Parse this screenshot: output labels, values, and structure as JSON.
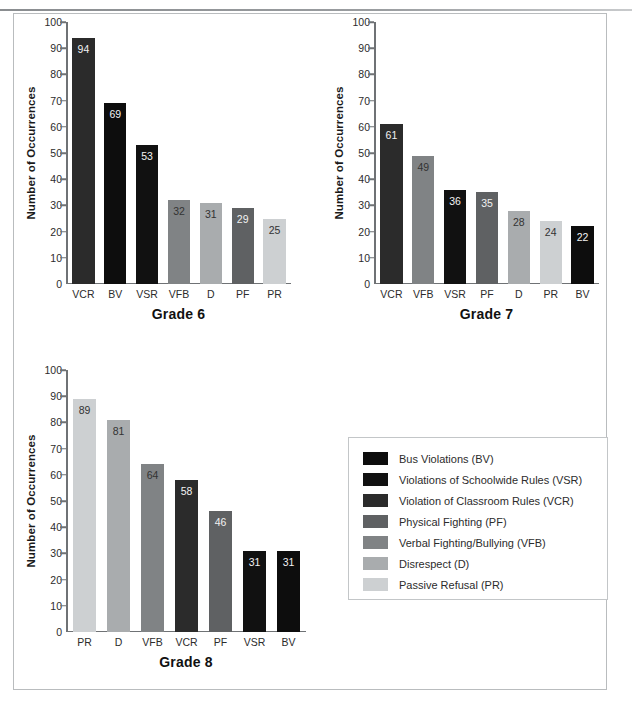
{
  "figure": {
    "width": 632,
    "height": 705,
    "background": "#ffffff",
    "frame_color": "#b9bcbe",
    "axis_color": "#6f7275"
  },
  "category_colors": {
    "BV": "#0d0d0d",
    "VSR": "#111111",
    "VCR": "#2b2b2b",
    "PF": "#5f6163",
    "VFB": "#808385",
    "D": "#a9acae",
    "PR": "#cdd0d2"
  },
  "category_label_colors": {
    "BV": "#f2f2f2",
    "VSR": "#f2f2f2",
    "VCR": "#f2f2f2",
    "PF": "#f2f2f2",
    "VFB": "#333333",
    "D": "#333333",
    "PR": "#333333"
  },
  "legend": {
    "title": "",
    "items": [
      {
        "code": "BV",
        "label": "Bus Violations (BV)"
      },
      {
        "code": "VSR",
        "label": "Violations of Schoolwide Rules (VSR)"
      },
      {
        "code": "VCR",
        "label": "Violation of Classroom Rules (VCR)"
      },
      {
        "code": "PF",
        "label": "Physical Fighting (PF)"
      },
      {
        "code": "VFB",
        "label": "Verbal Fighting/Bullying (VFB)"
      },
      {
        "code": "D",
        "label": "Disrespect (D)"
      },
      {
        "code": "PR",
        "label": "Passive Refusal (PR)"
      }
    ]
  },
  "chart_data": [
    {
      "type": "bar",
      "title": "Grade 6",
      "xlabel": "",
      "ylabel": "Number of Occurrences",
      "ylim": [
        0,
        100
      ],
      "yticks": [
        0,
        10,
        20,
        30,
        40,
        50,
        60,
        70,
        80,
        90,
        100
      ],
      "grid": false,
      "legend_position": "external",
      "categories": [
        "VCR",
        "BV",
        "VSR",
        "VFB",
        "D",
        "PF",
        "PR"
      ],
      "values": [
        94,
        69,
        53,
        32,
        31,
        29,
        25
      ]
    },
    {
      "type": "bar",
      "title": "Grade 7",
      "xlabel": "",
      "ylabel": "Number of Occurrences",
      "ylim": [
        0,
        100
      ],
      "yticks": [
        0,
        10,
        20,
        30,
        40,
        50,
        60,
        70,
        80,
        90,
        100
      ],
      "grid": false,
      "legend_position": "external",
      "categories": [
        "VCR",
        "VFB",
        "VSR",
        "PF",
        "D",
        "PR",
        "BV"
      ],
      "values": [
        61,
        49,
        36,
        35,
        28,
        24,
        22
      ]
    },
    {
      "type": "bar",
      "title": "Grade 8",
      "xlabel": "",
      "ylabel": "Number of Occurrences",
      "ylim": [
        0,
        100
      ],
      "yticks": [
        0,
        10,
        20,
        30,
        40,
        50,
        60,
        70,
        80,
        90,
        100
      ],
      "grid": false,
      "legend_position": "external",
      "categories": [
        "PR",
        "D",
        "VFB",
        "VCR",
        "PF",
        "VSR",
        "BV"
      ],
      "values": [
        89,
        81,
        64,
        58,
        46,
        31,
        31
      ]
    }
  ]
}
